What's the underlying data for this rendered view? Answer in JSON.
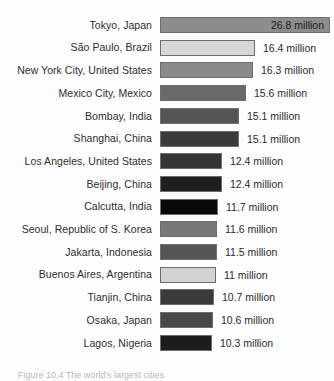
{
  "chart_data": {
    "type": "bar",
    "orientation": "horizontal",
    "title": "",
    "xlabel": "",
    "ylabel": "",
    "unit": "million",
    "grid": false,
    "legend": false,
    "categories": [
      "Tokyo, Japan",
      "São Paulo, Brazil",
      "New York City, United States",
      "Mexico City, Mexico",
      "Bombay, India",
      "Shanghai, China",
      "Los Angeles, United States",
      "Beijing, China",
      "Calcutta, India",
      "Seoul, Republic of S. Korea",
      "Jakarta, Indonesia",
      "Buenos Aires, Argentina",
      "Tianjin, China",
      "Osaka, Japan",
      "Lagos, Nigeria"
    ],
    "values": [
      26.8,
      16.4,
      16.3,
      15.6,
      15.1,
      15.1,
      12.4,
      12.4,
      11.7,
      11.6,
      11.5,
      11.0,
      10.7,
      10.6,
      10.3
    ],
    "value_labels": [
      "26.8 million",
      "16.4 million",
      "16.3 million",
      "15.6 million",
      "15.1 million",
      "15.1 million",
      "12.4 million",
      "12.4 million",
      "11.7 million",
      "11.6 million",
      "11.5 million",
      "11 million",
      "10.7 million",
      "10.6 million",
      "10.3 million"
    ],
    "bar_pixel_lengths": [
      170,
      95,
      93,
      86,
      79,
      79,
      62,
      62,
      58,
      57,
      57,
      56,
      54,
      53,
      52
    ],
    "bar_colors": [
      "#8d8d8d",
      "#d6d6d6",
      "#8a8a8a",
      "#6a6a6a",
      "#555555",
      "#3b3b3b",
      "#353535",
      "#1f1f1f",
      "#0a0a0a",
      "#777777",
      "#555555",
      "#d2d2d2",
      "#3a3a3a",
      "#484848",
      "#1c1c1c"
    ],
    "label_inside_bar": [
      true,
      false,
      false,
      false,
      false,
      false,
      false,
      false,
      false,
      false,
      false,
      false,
      false,
      false,
      false
    ],
    "row_pitch_px": 22.7,
    "bar_origin_px": 160
  },
  "caption": {
    "text": "Figure 10.4  The world's largest cities"
  }
}
